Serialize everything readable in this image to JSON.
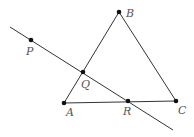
{
  "diagram": {
    "type": "geometry",
    "points": [
      {
        "id": "B",
        "label": "B",
        "x": 119,
        "y": 12,
        "lx": 126,
        "ly": 17
      },
      {
        "id": "P",
        "label": "P",
        "x": 31,
        "y": 40,
        "lx": 26,
        "ly": 55
      },
      {
        "id": "Q",
        "label": "Q",
        "x": 83,
        "y": 72,
        "lx": 81,
        "ly": 88
      },
      {
        "id": "A",
        "label": "A",
        "x": 64,
        "y": 103,
        "lx": 66,
        "ly": 116
      },
      {
        "id": "R",
        "label": "R",
        "x": 128,
        "y": 101,
        "lx": 123,
        "ly": 115
      },
      {
        "id": "C",
        "label": "C",
        "x": 176,
        "y": 101,
        "lx": 178,
        "ly": 114
      }
    ],
    "segments": [
      {
        "from": "A",
        "to": "B"
      },
      {
        "from": "B",
        "to": "C"
      },
      {
        "from": "A",
        "to": "C"
      }
    ],
    "lines": [
      {
        "through": [
          "P",
          "Q",
          "R"
        ],
        "x1": 10,
        "y1": 27,
        "x2": 173,
        "y2": 130
      }
    ]
  }
}
